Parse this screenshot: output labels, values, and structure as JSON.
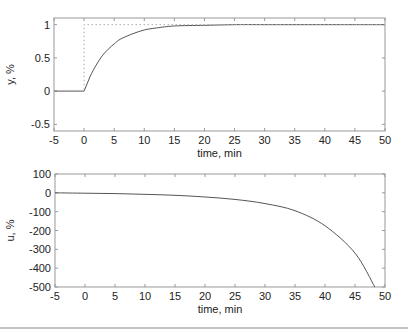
{
  "chart_data": [
    {
      "type": "line",
      "title": "",
      "xlabel": "time, min",
      "ylabel": "y, %",
      "xlim": [
        -5,
        50
      ],
      "ylim": [
        -0.6,
        1.1
      ],
      "xticks": [
        -5,
        0,
        5,
        10,
        15,
        20,
        25,
        30,
        35,
        40,
        45,
        50
      ],
      "xtick_labels": [
        "-5",
        "0",
        "5",
        "10",
        "15",
        "20",
        "25",
        "30",
        "35",
        "40",
        "45",
        "50"
      ],
      "yticks": [
        -0.5,
        0,
        0.5,
        1
      ],
      "ytick_labels": [
        "-0.5",
        "0",
        "0.5",
        "1"
      ],
      "grid": false,
      "series": [
        {
          "name": "y (output)",
          "style": "solid",
          "color": "#555555",
          "x": [
            -5,
            0,
            1,
            2,
            3,
            4,
            5,
            6,
            8,
            10,
            12,
            15,
            20,
            25,
            30,
            40,
            50
          ],
          "y": [
            0,
            0,
            0.22,
            0.39,
            0.53,
            0.63,
            0.71,
            0.78,
            0.86,
            0.92,
            0.95,
            0.98,
            0.99,
            1.0,
            1.0,
            1.0,
            1.0
          ]
        },
        {
          "name": "setpoint",
          "style": "dotted",
          "color": "#999999",
          "x": [
            -5,
            0,
            0,
            50
          ],
          "y": [
            0,
            0,
            1,
            1
          ]
        }
      ]
    },
    {
      "type": "line",
      "title": "",
      "xlabel": "time, min",
      "ylabel": "u, %",
      "xlim": [
        -5,
        50
      ],
      "ylim": [
        -500,
        100
      ],
      "xticks": [
        -5,
        0,
        5,
        10,
        15,
        20,
        25,
        30,
        35,
        40,
        45,
        50
      ],
      "xtick_labels": [
        "-5",
        "0",
        "5",
        "10",
        "15",
        "20",
        "25",
        "30",
        "35",
        "40",
        "45",
        "50"
      ],
      "yticks": [
        -500,
        -400,
        -300,
        -200,
        -100,
        0,
        100
      ],
      "ytick_labels": [
        "-500",
        "-400",
        "-300",
        "-200",
        "-100",
        "0",
        "100"
      ],
      "grid": false,
      "series": [
        {
          "name": "u (input)",
          "style": "solid",
          "color": "#555555",
          "x": [
            -5,
            0,
            5,
            10,
            15,
            20,
            25,
            30,
            35,
            40,
            45,
            48.3
          ],
          "y": [
            0,
            -2,
            -4,
            -8,
            -13,
            -22,
            -35,
            -57,
            -95,
            -175,
            -320,
            -500
          ]
        }
      ]
    }
  ],
  "plots": {
    "top": {
      "xlabel": "time, min",
      "ylabel": "y, %",
      "xtick_labels": [
        "-5",
        "0",
        "5",
        "10",
        "15",
        "20",
        "25",
        "30",
        "35",
        "40",
        "45",
        "50"
      ],
      "ytick_labels": [
        "-0.5",
        "0",
        "0.5",
        "1"
      ]
    },
    "bottom": {
      "xlabel": "time, min",
      "ylabel": "u, %",
      "xtick_labels": [
        "-5",
        "0",
        "5",
        "10",
        "15",
        "20",
        "25",
        "30",
        "35",
        "40",
        "45",
        "50"
      ],
      "ytick_labels": [
        "-500",
        "-400",
        "-300",
        "-200",
        "-100",
        "0",
        "100"
      ]
    }
  },
  "colors": {
    "axis": "#999999",
    "curve": "#555555",
    "setpoint": "#aaaaaa",
    "text": "#222222",
    "divider": "#888888"
  }
}
